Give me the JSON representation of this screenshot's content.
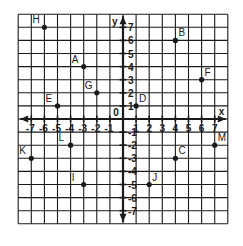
{
  "figure": {
    "type": "coordinate-plane",
    "x_axis_label": "x",
    "y_axis_label": "y",
    "origin_label": "0",
    "x_range": [
      -8,
      8
    ],
    "y_range": [
      -8,
      8
    ],
    "x_tick_labels": [
      "-7",
      "-6",
      "-5",
      "-4",
      "-3",
      "-2",
      "-1",
      "1",
      "2",
      "3",
      "4",
      "5",
      "6",
      "7"
    ],
    "y_tick_labels": [
      "7",
      "6",
      "5",
      "4",
      "3",
      "2",
      "1",
      "-1",
      "-2",
      "-3",
      "-4",
      "-5",
      "-6",
      "-7"
    ],
    "grid": true,
    "line_color": "#1a1a1a",
    "points": [
      {
        "label": "H",
        "x": -6,
        "y": 7
      },
      {
        "label": "A",
        "x": -3,
        "y": 4
      },
      {
        "label": "G",
        "x": -2,
        "y": 2
      },
      {
        "label": "E",
        "x": -5,
        "y": 1
      },
      {
        "label": "B",
        "x": 4,
        "y": 6
      },
      {
        "label": "F",
        "x": 6,
        "y": 3
      },
      {
        "label": "D",
        "x": 1,
        "y": 1
      },
      {
        "label": "L",
        "x": -4,
        "y": -2
      },
      {
        "label": "K",
        "x": -7,
        "y": -3
      },
      {
        "label": "I",
        "x": -3,
        "y": -5
      },
      {
        "label": "J",
        "x": 2,
        "y": -5
      },
      {
        "label": "C",
        "x": 4,
        "y": -3
      },
      {
        "label": "M",
        "x": 7,
        "y": -2
      }
    ]
  }
}
